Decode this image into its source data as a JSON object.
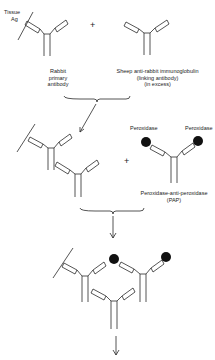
{
  "labels": {
    "tissue_ag_line1": "Tissue",
    "tissue_ag_line2": "Ag",
    "rabbit_line1": "Rabbit",
    "rabbit_line2": "primary",
    "rabbit_line3": "antibody",
    "sheep_line1": "Sheep anti-rabbit immunoglobulin",
    "sheep_line2": "(linking antibody)",
    "sheep_line3": "(in excess)",
    "peroxidase_left": "Peroxidase",
    "peroxidase_right": "Peroxidase",
    "pap_line1": "Peroxidase-anti-peroxidase",
    "pap_line2": "(PAP)",
    "plus_1": "+",
    "plus_2": "+"
  },
  "colors": {
    "line": "#2a2a2a",
    "peroxidase": "#111111",
    "background": "#ffffff"
  }
}
